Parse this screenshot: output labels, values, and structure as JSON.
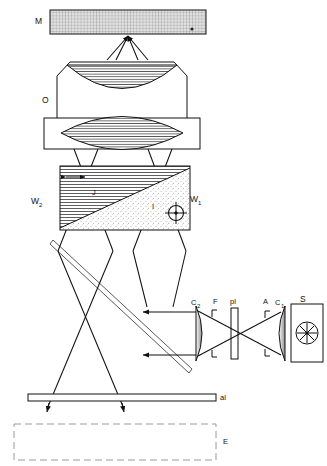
{
  "figure": {
    "background_color": "#ffffff",
    "line_color": "#111111",
    "width": 327,
    "height": 466
  },
  "components": {
    "mirror_top": {
      "id": "M",
      "label": "M",
      "description": "cross-hatched grid mirror / reference surface at top",
      "x": 50,
      "y": 10,
      "width": 156,
      "height": 24,
      "pattern": "fine-grid"
    },
    "objective": {
      "id": "O",
      "label": "O",
      "description": "objective lens assembly with concave and biconvex hatched lens elements",
      "x": 57,
      "y": 62,
      "width": 130,
      "height": 87
    },
    "wedge_left": {
      "id": "W2",
      "label": "W",
      "subscript": "2",
      "description": "upper-left wedge with horizontal line hatching",
      "pattern": "horizontal-lines"
    },
    "wedge_right": {
      "id": "W1",
      "label": "W",
      "subscript": "1",
      "description": "lower-right wedge with stipple dot pattern",
      "pattern": "stipple"
    },
    "beam_splitter_block": {
      "x": 60,
      "y": 166,
      "width": 130,
      "height": 64,
      "diagonal": "from bottom-left to top-right"
    },
    "marker_J": {
      "label": "J",
      "x": 93,
      "y": 190
    },
    "marker_I": {
      "label": "I",
      "x": 152,
      "y": 204
    },
    "crosshair_target": {
      "label": "crosshair",
      "cx": 176,
      "cy": 213,
      "r": 7.5
    },
    "double_arrow": {
      "description": "double-headed horizontal arrow indicating wedge shear",
      "x1": 64,
      "x2": 86,
      "y": 177
    },
    "mirror_diagonal": {
      "description": "tilted plane mirror, double-line, lower left",
      "x1": 53,
      "y1": 240,
      "x2": 192,
      "y2": 370
    },
    "lens_c2": {
      "id": "C2",
      "label": "C",
      "subscript": "2",
      "description": "collector lens 2, plano-convex shaded"
    },
    "filter_F": {
      "id": "F",
      "label": "F",
      "description": "filter position between C2 and pl"
    },
    "polarizer_pl": {
      "id": "pl",
      "label": "pl",
      "description": "plate / polarizer, vertical rectangle"
    },
    "aperture_A": {
      "id": "A",
      "label": "A",
      "description": "aperture stop"
    },
    "lens_c1": {
      "id": "C1",
      "label": "C",
      "subscript": "1",
      "description": "condenser lens 1, plano-convex shaded"
    },
    "source_S": {
      "id": "S",
      "label": "S",
      "description": "lamp housing with star-shaped filament"
    },
    "slide_al": {
      "id": "al",
      "label": "al",
      "description": "horizontal thin slide / specimen plane bar"
    },
    "eye_plane_E": {
      "id": "E",
      "label": "E",
      "description": "dashed rectangle denoting image / eye plane"
    }
  },
  "labels": [
    {
      "text": "M",
      "x": 39,
      "y": 21
    },
    {
      "text": "O",
      "x": 45,
      "y": 100
    },
    {
      "text": "W",
      "x": 33,
      "y": 201,
      "sub": "2"
    },
    {
      "text": "W",
      "x": 191,
      "y": 199,
      "sub": "1"
    },
    {
      "text": "J",
      "x": 93,
      "y": 191
    },
    {
      "text": "I",
      "x": 153,
      "y": 206
    },
    {
      "text": "C",
      "x": 193,
      "y": 302,
      "sub": "2"
    },
    {
      "text": "F",
      "x": 215,
      "y": 301
    },
    {
      "text": "pl",
      "x": 234,
      "y": 301
    },
    {
      "text": "A",
      "x": 266,
      "y": 301
    },
    {
      "text": "C",
      "x": 277,
      "y": 302,
      "sub": "1"
    },
    {
      "text": "S",
      "x": 303,
      "y": 300
    },
    {
      "text": "al",
      "x": 222,
      "y": 396
    },
    {
      "text": "E",
      "x": 225,
      "y": 440
    }
  ]
}
